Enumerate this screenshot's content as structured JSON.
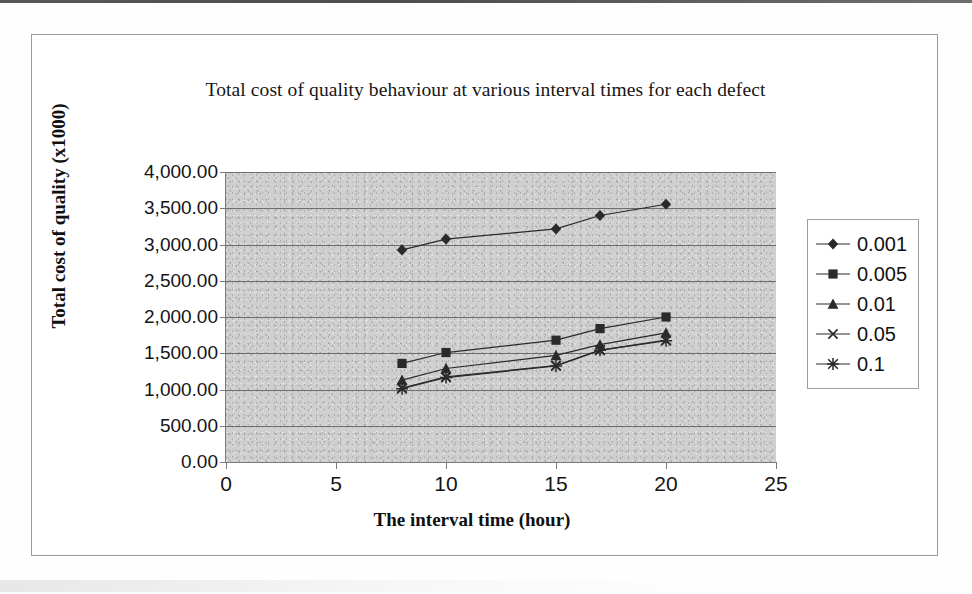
{
  "chart_data": {
    "type": "line",
    "title": "Total cost of quality behaviour at various interval times for each defect",
    "xlabel": "The interval time (hour)",
    "ylabel": "Total cost of quality (x1000)",
    "x": [
      8,
      10,
      15,
      17,
      20
    ],
    "xlim": [
      0,
      25
    ],
    "ylim": [
      0,
      4000
    ],
    "xticks": [
      "0",
      "5",
      "10",
      "15",
      "20",
      "25"
    ],
    "xtick_values": [
      0,
      5,
      10,
      15,
      20,
      25
    ],
    "yticks": [
      "0.00",
      "500.00",
      "1,000.00",
      "1,500.00",
      "2,000.00",
      "2,500.00",
      "3,000.00",
      "3,500.00",
      "4,000.00"
    ],
    "ytick_values": [
      0,
      500,
      1000,
      1500,
      2000,
      2500,
      3000,
      3500,
      4000
    ],
    "grid": "horizontal",
    "legend_position": "right",
    "plot_background": "#cfcfcf",
    "series_color": "#2a2a2a",
    "series": [
      {
        "name": "0.001",
        "marker": "diamond",
        "values": [
          2925,
          3075,
          3215,
          3400,
          3555
        ]
      },
      {
        "name": "0.005",
        "marker": "square",
        "values": [
          1360,
          1510,
          1680,
          1840,
          2000
        ]
      },
      {
        "name": "0.01",
        "marker": "triangle",
        "values": [
          1130,
          1290,
          1470,
          1620,
          1780
        ]
      },
      {
        "name": "0.05",
        "marker": "cross",
        "values": [
          1020,
          1175,
          1330,
          1545,
          1680
        ]
      },
      {
        "name": "0.1",
        "marker": "star",
        "values": [
          1010,
          1165,
          1325,
          1540,
          1672
        ]
      }
    ]
  }
}
